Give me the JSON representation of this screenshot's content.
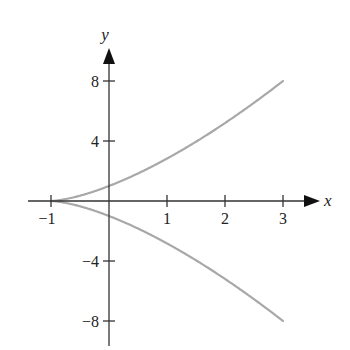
{
  "chart_data": {
    "type": "line",
    "title": "",
    "xlabel": "x",
    "ylabel": "y",
    "xlim": [
      -1.9,
      3.7
    ],
    "ylim": [
      -10,
      10.5
    ],
    "x_ticks": [
      -1,
      1,
      2,
      3
    ],
    "x_tick_labels": [
      "−1",
      "1",
      "2",
      "3"
    ],
    "y_ticks": [
      8,
      4,
      -4,
      -8
    ],
    "y_tick_labels": [
      "8",
      "4",
      "−4",
      "−8"
    ],
    "grid": false,
    "legend": null,
    "series": [
      {
        "name": "upper branch y = (x+1)^(3/2)",
        "x": [
          -1,
          -0.5,
          0,
          0.5,
          1,
          1.5,
          2,
          2.5,
          3
        ],
        "y": [
          0,
          0.35,
          1,
          1.84,
          2.83,
          3.95,
          5.2,
          6.55,
          8
        ],
        "color": "#a8a8a8"
      },
      {
        "name": "lower branch y = -(x+1)^(3/2)",
        "x": [
          -1,
          -0.5,
          0,
          0.5,
          1,
          1.5,
          2,
          2.5,
          3
        ],
        "y": [
          0,
          -0.35,
          -1,
          -1.84,
          -2.83,
          -3.95,
          -5.2,
          -6.55,
          -8
        ],
        "color": "#a8a8a8"
      }
    ],
    "axis_color": "#333333"
  }
}
